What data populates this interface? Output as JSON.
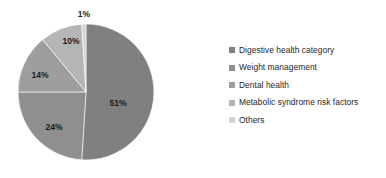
{
  "chart_data": {
    "type": "pie",
    "title": "",
    "subtitle": "",
    "xlabel": "",
    "ylabel": "",
    "grid": false,
    "legend_position": "right",
    "categories": [
      "Digestive health category",
      "Weight management",
      "Dental health",
      "Metabolic syndrome risk factors",
      "Others"
    ],
    "values": [
      51,
      24,
      14,
      10,
      1
    ],
    "data_labels": [
      "51%",
      "24%",
      "14%",
      "10%",
      "1%"
    ],
    "colors": [
      "#808080",
      "#8f8f8f",
      "#9e9e9e",
      "#b5b5b5",
      "#d4d4d4"
    ],
    "label_color": "#1a1a1a",
    "start_angle_deg": 0,
    "direction": "clockwise"
  },
  "legend": {
    "items": [
      {
        "label": "Digestive health category",
        "color": "#808080",
        "value": 51
      },
      {
        "label": "Weight management",
        "color": "#8f8f8f",
        "value": 24
      },
      {
        "label": "Dental health",
        "color": "#9e9e9e",
        "value": 14
      },
      {
        "label": "Metabolic syndrome risk factors",
        "color": "#b5b5b5",
        "value": 10
      },
      {
        "label": "Others",
        "color": "#d4d4d4",
        "value": 1
      }
    ]
  },
  "pie": {
    "center_x": 86,
    "center_y": 92,
    "radius": 68,
    "slices": [
      {
        "name": "Digestive health category",
        "percent": 51,
        "label": "51%",
        "color": "#808080",
        "label_x": 118,
        "label_y": 104
      },
      {
        "name": "Weight management",
        "percent": 24,
        "label": "24%",
        "color": "#8f8f8f",
        "label_x": 54,
        "label_y": 128
      },
      {
        "name": "Dental health",
        "percent": 14,
        "label": "14%",
        "color": "#9e9e9e",
        "label_x": 40,
        "label_y": 76
      },
      {
        "name": "Metabolic syndrome risk factors",
        "percent": 10,
        "label": "10%",
        "color": "#b5b5b5",
        "label_x": 71,
        "label_y": 42
      },
      {
        "name": "Others",
        "percent": 1,
        "label": "1%",
        "color": "#d4d4d4",
        "label_x": 84,
        "label_y": 15
      }
    ]
  }
}
